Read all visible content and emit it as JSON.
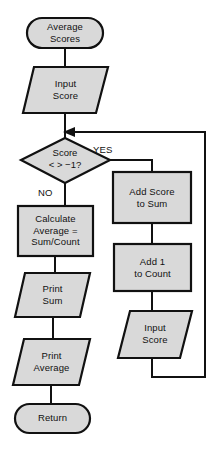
{
  "diagram": {
    "type": "flowchart",
    "title": "Average Scores",
    "background_color": "#ffffff",
    "shape_fill_color": "#d9d9d9",
    "shape_stroke_color": "#111111",
    "nodes": [
      {
        "id": "start",
        "shape": "terminator",
        "label": "Average\nScores"
      },
      {
        "id": "input1",
        "shape": "parallelogram",
        "label": "Input\nScore"
      },
      {
        "id": "decision",
        "shape": "diamond",
        "label": "Score\n< >  −1?"
      },
      {
        "id": "calc",
        "shape": "rectangle",
        "label": "Calculate\nAverage  =\nSum/Count"
      },
      {
        "id": "printsum",
        "shape": "parallelogram",
        "label": "Print\nSum"
      },
      {
        "id": "printavg",
        "shape": "parallelogram",
        "label": "Print\nAverage"
      },
      {
        "id": "return",
        "shape": "terminator",
        "label": "Return"
      },
      {
        "id": "addscore",
        "shape": "rectangle",
        "label": "Add Score\nto Sum"
      },
      {
        "id": "addcount",
        "shape": "rectangle",
        "label": "Add 1\nto Count"
      },
      {
        "id": "input2",
        "shape": "parallelogram",
        "label": "Input\nScore"
      }
    ],
    "edge_labels": {
      "yes": "YES",
      "no": "NO"
    }
  }
}
